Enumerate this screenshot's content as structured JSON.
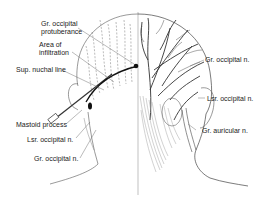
{
  "diagram": {
    "left_labels": [
      {
        "id": "gr-occ-protuberance",
        "lines": [
          "Gr. occipital",
          "protuberance"
        ]
      },
      {
        "id": "area-infiltration",
        "lines": [
          "Area of",
          "infiltration"
        ]
      },
      {
        "id": "sup-nuchal-line",
        "lines": [
          "Sup. nuchal line"
        ]
      },
      {
        "id": "mastoid-process",
        "lines": [
          "Mastoid process"
        ]
      },
      {
        "id": "lsr-occipital-left",
        "lines": [
          "Lsr. occipital n."
        ]
      },
      {
        "id": "gr-occipital-left",
        "lines": [
          "Gr. occipital n."
        ]
      }
    ],
    "right_labels": [
      {
        "id": "gr-occipital-right",
        "lines": [
          "Gr. occipital n."
        ]
      },
      {
        "id": "lsr-occipital-right",
        "lines": [
          "Lsr. occipital n."
        ]
      },
      {
        "id": "gr-auricular-right",
        "lines": [
          "Gr. auricular n."
        ]
      }
    ],
    "colors": {
      "ink": "#1a1a1a",
      "line": "#555555",
      "dashed": "#777777",
      "hatch": "#9a9a9a",
      "background": "#ffffff"
    }
  }
}
